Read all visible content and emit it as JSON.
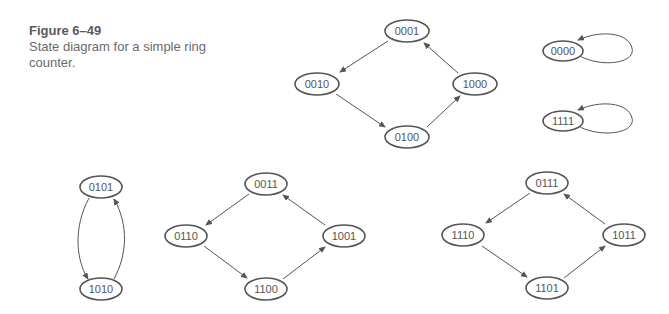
{
  "caption": {
    "figure_label": "Figure  6–49",
    "text": "State diagram for a simple ring counter."
  },
  "diagram": {
    "stroke_color": "#555555",
    "groups": [
      {
        "name": "main-ring",
        "states": [
          "0001",
          "0010",
          "0100",
          "1000"
        ],
        "transitions": [
          [
            "0001",
            "0010"
          ],
          [
            "0010",
            "0100"
          ],
          [
            "0100",
            "1000"
          ],
          [
            "1000",
            "0001"
          ]
        ]
      },
      {
        "name": "self-loop-0000",
        "states": [
          "0000"
        ],
        "transitions": [
          [
            "0000",
            "0000"
          ]
        ]
      },
      {
        "name": "self-loop-1111",
        "states": [
          "1111"
        ],
        "transitions": [
          [
            "1111",
            "1111"
          ]
        ]
      },
      {
        "name": "pair-0101-1010",
        "states": [
          "0101",
          "1010"
        ],
        "transitions": [
          [
            "0101",
            "1010"
          ],
          [
            "1010",
            "0101"
          ]
        ]
      },
      {
        "name": "ring-0011",
        "states": [
          "0011",
          "0110",
          "1100",
          "1001"
        ],
        "transitions": [
          [
            "0011",
            "0110"
          ],
          [
            "0110",
            "1100"
          ],
          [
            "1100",
            "1001"
          ],
          [
            "1001",
            "0011"
          ]
        ]
      },
      {
        "name": "ring-0111",
        "states": [
          "0111",
          "1110",
          "1101",
          "1011"
        ],
        "transitions": [
          [
            "0111",
            "1110"
          ],
          [
            "1110",
            "1101"
          ],
          [
            "1101",
            "1011"
          ],
          [
            "1011",
            "0111"
          ]
        ]
      }
    ],
    "labels": {
      "s0001": "0001",
      "s0010": "0010",
      "s0100": "0100",
      "s1000": "1000",
      "s0000": "0000",
      "s1111": "1111",
      "s0101": "0101",
      "s1010": "1010",
      "s0011": "0011",
      "s0110": "0110",
      "s1100": "1100",
      "s1001": "1001",
      "s0111": "0111",
      "s1110": "1110",
      "s1101": "1101",
      "s1011": "1011"
    }
  }
}
